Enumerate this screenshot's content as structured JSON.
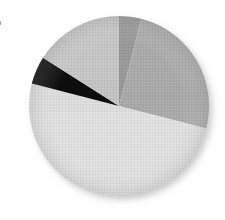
{
  "figure": {
    "edge_glyph": "b",
    "background_color": "#ffffff"
  },
  "chart_data": {
    "type": "pie",
    "title": "",
    "subtitle": "",
    "xlabel": "",
    "ylabel": "",
    "legend_position": "none",
    "grid": false,
    "start_angle_deg": 0,
    "direction": "clockwise",
    "center": {
      "x": 119,
      "y": 106
    },
    "radius": 90,
    "labels": [
      "Segment 1",
      "Segment 2",
      "Segment 3",
      "Segment 4",
      "Segment 5"
    ],
    "values": [
      4,
      25,
      50,
      5,
      16
    ],
    "percentages": [
      4,
      25,
      50,
      5,
      16
    ],
    "colors": [
      "#9c9c9c",
      "#aeaeae",
      "#e3e3e3",
      "#0d0d0d",
      "#c9c9c9"
    ],
    "slices": [
      {
        "label": "Segment 1",
        "value": 4,
        "percent": 4,
        "color": "#9c9c9c",
        "start_angle_deg": 0,
        "end_angle_deg": 14.4
      },
      {
        "label": "Segment 2",
        "value": 25,
        "percent": 25,
        "color": "#aeaeae",
        "start_angle_deg": 14.4,
        "end_angle_deg": 104.4
      },
      {
        "label": "Segment 3",
        "value": 50,
        "percent": 50,
        "color": "#e3e3e3",
        "start_angle_deg": 104.4,
        "end_angle_deg": 284.4
      },
      {
        "label": "Segment 4",
        "value": 5,
        "percent": 5,
        "color": "#0d0d0d",
        "start_angle_deg": 284.4,
        "end_angle_deg": 302.4
      },
      {
        "label": "Segment 5",
        "value": 16,
        "percent": 16,
        "color": "#c9c9c9",
        "start_angle_deg": 302.4,
        "end_angle_deg": 360
      }
    ]
  }
}
